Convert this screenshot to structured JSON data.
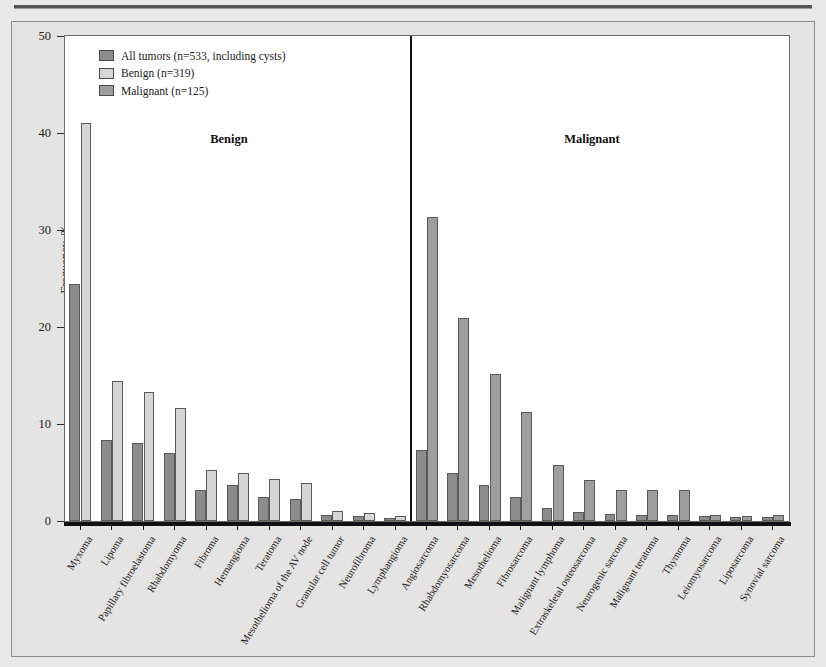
{
  "figure": {
    "y_axis_title": "Frequency, %",
    "section_benign_label": "Benign",
    "section_malignant_label": "Malignant"
  },
  "legend": {
    "items": [
      {
        "label": "All tumors (n=533, including cysts)",
        "color": "#8c8c8a",
        "key": "all"
      },
      {
        "label": "Benign (n=319)",
        "color": "#d6d6d2",
        "key": "benign"
      },
      {
        "label": "Malignant (n=125)",
        "color": "#9e9e9c",
        "key": "malignant"
      }
    ]
  },
  "chart_data": {
    "type": "bar",
    "title": "",
    "xlabel": "",
    "ylabel": "Frequency, %",
    "ylim": [
      0,
      50
    ],
    "yticks": [
      0,
      10,
      20,
      30,
      40,
      50
    ],
    "grid": false,
    "legend_position": "top-left",
    "sections": [
      {
        "name": "Benign",
        "categories": [
          "Myxoma",
          "Lipoma",
          "Papillary fibroelastoma",
          "Rhabdomyoma",
          "Fibroma",
          "Hemangioma",
          "Teratoma",
          "Mesothelioma of the AV node",
          "Granular cell tumor",
          "Neurofibroma",
          "Lymphangioma"
        ],
        "series": [
          {
            "name": "All tumors (n=533, including cysts)",
            "values": [
              24.4,
              8.4,
              8.0,
              7.0,
              3.2,
              3.7,
              2.5,
              2.3,
              0.6,
              0.5,
              0.3
            ]
          },
          {
            "name": "Benign (n=319)",
            "values": [
              41.0,
              14.4,
              13.3,
              11.7,
              5.3,
              4.9,
              4.3,
              3.9,
              1.0,
              0.8,
              0.5
            ]
          }
        ]
      },
      {
        "name": "Malignant",
        "categories": [
          "Angiosarcoma",
          "Rhabdomyosarcoma",
          "Mesothelioma",
          "Fibrosarcoma",
          "Malignant lymphoma",
          "Extraskeletal osteosarcoma",
          "Neurogenic sarcoma",
          "Malignant teratoma",
          "Thymoma",
          "Leiomyosarcoma",
          "Liposarcoma",
          "Synovial sarcoma"
        ],
        "series": [
          {
            "name": "All tumors (n=533, including cysts)",
            "values": [
              7.3,
              4.9,
              3.7,
              2.5,
              1.3,
              0.9,
              0.7,
              0.6,
              0.6,
              0.5,
              0.4,
              0.4
            ]
          },
          {
            "name": "Malignant (n=125)",
            "values": [
              31.3,
              20.9,
              15.2,
              11.2,
              5.8,
              4.2,
              3.2,
              3.2,
              3.2,
              0.6,
              0.5,
              0.6
            ]
          }
        ]
      }
    ]
  }
}
